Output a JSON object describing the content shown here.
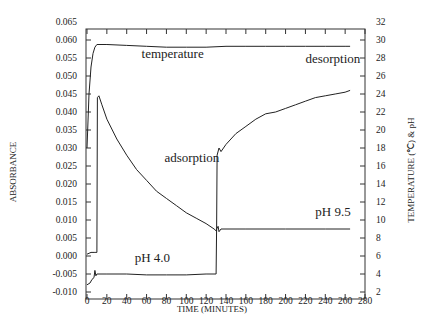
{
  "chart_data": {
    "type": "line",
    "title": "",
    "xlabel": "TIME (MINUTES)",
    "ylabel": "ABSORBANCE",
    "y2label": "TEMPERATURE (℃) & pH",
    "xlim": [
      0,
      280
    ],
    "ylim": [
      -0.01,
      0.065
    ],
    "y2lim": [
      2,
      32
    ],
    "grid": false,
    "x_ticks": [
      0,
      20,
      40,
      60,
      80,
      100,
      120,
      140,
      160,
      180,
      200,
      220,
      240,
      260,
      280
    ],
    "y_ticks": [
      "0.065",
      "0.060",
      "0.055",
      "0.050",
      "0.045",
      "0.040",
      "0.035",
      "0.030",
      "0.025",
      "0.020",
      "0.015",
      "0.010",
      "0.005",
      "0.000",
      "-0.005",
      "-0.010"
    ],
    "y2_ticks": [
      32,
      30,
      28,
      26,
      24,
      22,
      20,
      18,
      16,
      14,
      12,
      10,
      8,
      6,
      4,
      2
    ],
    "series": [
      {
        "name": "absorbance",
        "axis": "left",
        "x": [
          0,
          4,
          8,
          9,
          10,
          10.5,
          12,
          15,
          20,
          30,
          40,
          50,
          60,
          70,
          80,
          90,
          100,
          110,
          120,
          128,
          130,
          130.5,
          131,
          133,
          135,
          140,
          150,
          160,
          170,
          180,
          190,
          200,
          210,
          220,
          230,
          240,
          250,
          260,
          265
        ],
        "values": [
          0.0005,
          0.001,
          0.001,
          0.001,
          0.001,
          0.044,
          0.0445,
          0.042,
          0.038,
          0.0325,
          0.028,
          0.024,
          0.021,
          0.018,
          0.016,
          0.014,
          0.012,
          0.0105,
          0.009,
          0.0075,
          0.007,
          0.007,
          0.028,
          0.03,
          0.029,
          0.031,
          0.034,
          0.036,
          0.038,
          0.0395,
          0.04,
          0.041,
          0.042,
          0.043,
          0.044,
          0.0445,
          0.045,
          0.0455,
          0.046
        ]
      },
      {
        "name": "temperature",
        "axis": "right",
        "x": [
          0,
          2,
          4,
          6,
          8,
          10,
          20,
          40,
          60,
          80,
          100,
          120,
          140,
          160,
          180,
          200,
          220,
          240,
          260,
          265
        ],
        "values": [
          18,
          24,
          27,
          28.5,
          29.2,
          29.5,
          29.5,
          29.4,
          29.3,
          29.2,
          29.2,
          29.2,
          29.3,
          29.3,
          29.3,
          29.3,
          29.3,
          29.3,
          29.3,
          29.3
        ]
      },
      {
        "name": "pH",
        "axis": "right",
        "x": [
          0,
          3,
          5,
          7,
          8,
          9,
          10,
          20,
          40,
          60,
          80,
          100,
          120,
          130,
          130.5,
          132,
          133,
          135,
          140,
          160,
          200,
          240,
          265
        ],
        "values": [
          2.8,
          3.0,
          3.4,
          3.6,
          4.4,
          3.8,
          4.0,
          4.0,
          4.0,
          3.9,
          3.9,
          3.9,
          4.0,
          4.0,
          9.0,
          9.3,
          8.7,
          9.0,
          9.0,
          9.0,
          9.0,
          9.0,
          9.0
        ]
      }
    ],
    "annotations": [
      {
        "text": "temperature",
        "x": 55,
        "y2": 28
      },
      {
        "text": "desorption",
        "x": 220,
        "y2": 27.5
      },
      {
        "text": "adsorption",
        "x": 78,
        "y2": 16.5
      },
      {
        "text": "pH 9.5",
        "x": 230,
        "y2": 10.5
      },
      {
        "text": "pH 4.0",
        "x": 48,
        "y2": 5.3
      }
    ]
  },
  "caption_partial": "(clipped caption text below axis)"
}
